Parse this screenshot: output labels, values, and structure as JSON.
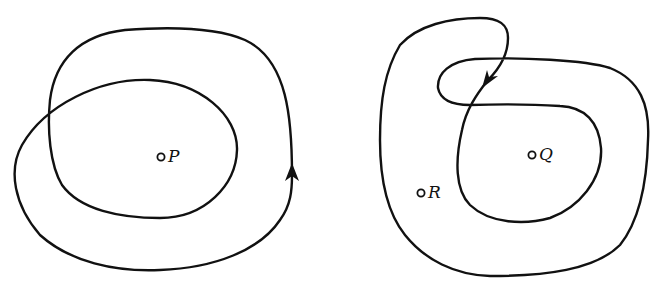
{
  "figures": [
    {
      "id": "left",
      "description": "Closed curve winding twice around P",
      "points": [
        {
          "label": "P",
          "x": 161,
          "y": 157
        }
      ],
      "arrow": {
        "direction": "up",
        "x": 292,
        "y": 172
      }
    },
    {
      "id": "right",
      "description": "Closed curve with a loop, winding around Q and R",
      "points": [
        {
          "label": "Q",
          "x": 532,
          "y": 155
        },
        {
          "label": "R",
          "x": 421,
          "y": 193
        }
      ],
      "arrow": {
        "direction": "down-left",
        "x": 488,
        "y": 80
      }
    }
  ],
  "labels": {
    "p": "P",
    "q": "Q",
    "r": "R"
  },
  "colors": {
    "stroke": "#111111",
    "background": "#ffffff"
  }
}
